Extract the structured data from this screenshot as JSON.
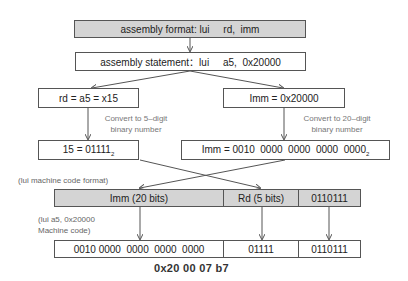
{
  "boxes": {
    "format": "assembly format: lui     rd,  imm",
    "statement": "assembly statement：lui     a5,  0x20000",
    "rd": "rd = a5 = x15",
    "imm": "Imm = 0x20000",
    "rd_bin": "15 = 01111",
    "rd_bin_sub": "2",
    "imm_bin": "Imm = 0010  0000  0000  0000  0000",
    "imm_bin_sub": "2"
  },
  "notes": {
    "convert_5": "Convert to 5–digit\nbinary number",
    "convert_20": "Convert to 20–digit\nbinary number"
  },
  "labels": {
    "format_label": "(lui machine code format)",
    "machine_label": "(lui a5, 0x20000\nMachine code)"
  },
  "format_fields": [
    {
      "label": "Imm (20 bits)"
    },
    {
      "label": "Rd (5 bits)"
    },
    {
      "label": "0110111"
    }
  ],
  "machine_fields": [
    {
      "label": "0010 0000  0000  0000  0000"
    },
    {
      "label": "01111"
    },
    {
      "label": "0110111"
    }
  ],
  "hex_result": "0x20 00 07 b7",
  "colors": {
    "gray_fill": "#d4d4d4",
    "border": "#555555",
    "arrow": "#555555"
  }
}
